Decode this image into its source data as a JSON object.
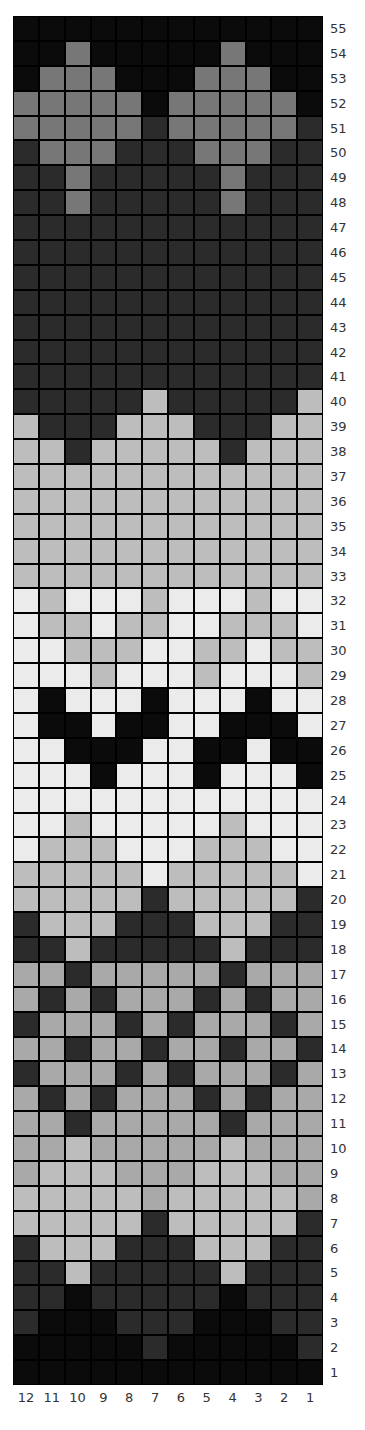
{
  "chart_data": {
    "type": "heatmap",
    "title": "",
    "palette": {
      "K": "#0b0b0b",
      "D": "#2b2b2b",
      "M": "#777777",
      "L": "#bdbdbd",
      "S": "#a9a9a9",
      "W": "#ebebeb"
    },
    "palette_names": {
      "K": "black",
      "D": "dark gray",
      "M": "medium gray",
      "L": "light gray",
      "S": "silver gray",
      "W": "off-white"
    },
    "column_labels": [
      "12",
      "11",
      "10",
      "9",
      "8",
      "7",
      "6",
      "5",
      "4",
      "3",
      "2",
      "1"
    ],
    "row_labels_top_to_bottom": [
      "55",
      "54",
      "53",
      "52",
      "51",
      "50",
      "49",
      "48",
      "47",
      "46",
      "45",
      "44",
      "43",
      "42",
      "41",
      "40",
      "39",
      "38",
      "37",
      "36",
      "35",
      "34",
      "33",
      "32",
      "31",
      "30",
      "29",
      "28",
      "27",
      "26",
      "25",
      "24",
      "23",
      "22",
      "21",
      "20",
      "19",
      "18",
      "17",
      "16",
      "15",
      "14",
      "13",
      "12",
      "11",
      "10",
      "9",
      "8",
      "7",
      "6",
      "5",
      "4",
      "3",
      "2",
      "1"
    ],
    "rows_top_to_bottom": [
      "KKKKKKKKKKKK",
      "KKMKKKKKMKKK",
      "KMMMKKKMMMKK",
      "MMMMMKMMMMMK",
      "MMMMMDMMMMMD",
      "DMMMDDDMMMDD",
      "DDMDDDDDMDDD",
      "DDMDDDDDMDDD",
      "DDDDDDDDDDDD",
      "DDDDDDDDDDDD",
      "DDDDDDDDDDDD",
      "DDDDDDDDDDDD",
      "DDDDDDDDDDDD",
      "DDDDDDDDDDDD",
      "DDDDDDDDDDDD",
      "DDDDDLDDDDDL",
      "LDDDLLLDDDLL",
      "LLDLLLLLDLLL",
      "LLLLLLLLLLLL",
      "LLLLLLLLLLLL",
      "LLLLLLLLLLLL",
      "LLLLLLLLLLLL",
      "LLLLLLLLLLLL",
      "WLWWWLWWWLWW",
      "WLLWLLWWLLLW",
      "WWLLLWWLLWLL",
      "WWWLWWWLWWWL",
      "WKWWWKWWWKWW",
      "WKKWKKWWKKKW",
      "WWKKKWWKKWKK",
      "WWWKWWWKWWWK",
      "WWWWWWWWWWWW",
      "WWLWWWWWLWWW",
      "WLLLWWWLLLWW",
      "LLLLLWLLLLLW",
      "LLLLLDLLLLLD",
      "DLLLDDDLLLDD",
      "DDLDDDDDLDDD",
      "SSDSSSSSDSSS",
      "SDSDSSSDSDSS",
      "DSSSDSDSSSDS",
      "SSDSSDSSDSSD",
      "DSSSDSDSSSDS",
      "SDSDSSSDSDSS",
      "SSDSSSSSDSSS",
      "SSLSSSSSLSSS",
      "SLLLSSSLLLSS",
      "LLLLLSLLLLLS",
      "LLLLLDLLLLLD",
      "DLLLDDDLLLDD",
      "DDLDDDDDLDDD",
      "DDKDDDDDKDDD",
      "DKKKDDDKKKDD",
      "KKKKKDKKKKKD",
      "KKKKKKKKKKKK"
    ],
    "xlabel": "",
    "ylabel": "",
    "grid": true
  }
}
